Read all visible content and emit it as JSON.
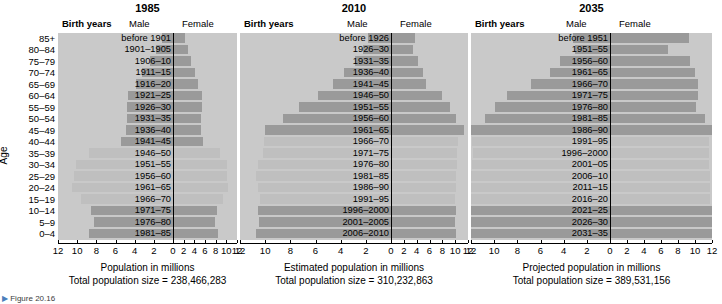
{
  "axis": {
    "age_title": "Age",
    "age_groups": [
      "85+",
      "80–84",
      "75–79",
      "70–74",
      "65–69",
      "60–64",
      "55–59",
      "50–54",
      "45–49",
      "40–44",
      "35–39",
      "30–34",
      "25–29",
      "20–24",
      "15–19",
      "10–14",
      "5–9",
      "0–4"
    ],
    "x_ticks": [
      "12",
      "10",
      "8",
      "6",
      "4",
      "2",
      "0",
      "2",
      "4",
      "6",
      "8",
      "10",
      "12"
    ],
    "x_tick_values": [
      -12,
      -10,
      -8,
      -6,
      -4,
      -2,
      0,
      2,
      4,
      6,
      8,
      10,
      12
    ]
  },
  "headers": {
    "birth_years": "Birth years",
    "male": "Male",
    "female": "Female"
  },
  "colors": {
    "plot_background": "#c9c9c9",
    "bar_dark": "#9a9a9a",
    "bar_light": "#bfbfbf",
    "centerline": "#000000",
    "page_background": "#ffffff"
  },
  "chart_data": {
    "type": "bar",
    "xlabel": "Population in millions",
    "ylabel": "Age",
    "xlim": [
      -12,
      12
    ],
    "grid": false,
    "legend": [
      "Male",
      "Female"
    ],
    "legend_position": "top",
    "categories": [
      "85+",
      "80–84",
      "75–79",
      "70–74",
      "65–69",
      "60–64",
      "55–59",
      "50–54",
      "45–49",
      "40–44",
      "35–39",
      "30–34",
      "25–29",
      "20–24",
      "15–19",
      "10–14",
      "5–9",
      "0–4"
    ],
    "panels": [
      {
        "year": "1985",
        "caption": "Population in millions",
        "total_label": "Total population size = 238,466,283",
        "total_population": 238466283,
        "birth_years": [
          "before 1901",
          "1901–1905",
          "1906–10",
          "1911–15",
          "1916–20",
          "1921–25",
          "1926–30",
          "1931–35",
          "1936–40",
          "1941–45",
          "1946–50",
          "1951–55",
          "1956–60",
          "1961–65",
          "1966–70",
          "1971–75",
          "1976–80",
          "1981–85"
        ],
        "series": [
          {
            "name": "Male",
            "values": [
              1.2,
              1.8,
              2.4,
              3.2,
              3.9,
              4.7,
              4.8,
              4.8,
              4.9,
              5.4,
              8.8,
              10.1,
              10.3,
              10.5,
              9.6,
              8.6,
              8.2,
              8.8
            ]
          },
          {
            "name": "Female",
            "values": [
              2.2,
              2.8,
              3.4,
              4.2,
              4.7,
              5.4,
              5.4,
              5.3,
              5.3,
              5.6,
              8.9,
              10.1,
              10.2,
              10.4,
              9.4,
              8.3,
              7.8,
              8.4
            ]
          }
        ],
        "boom_rows": [
          10,
          11,
          12,
          13,
          14
        ]
      },
      {
        "year": "2010",
        "caption": "Estimated population in millions",
        "total_label": "Total population size = 310,232,863",
        "total_population": 310232863,
        "birth_years": [
          "before 1926",
          "1926–30",
          "1931–35",
          "1936–40",
          "1941–45",
          "1946–50",
          "1951–55",
          "1956–60",
          "1961–65",
          "1966–70",
          "1971–75",
          "1976–80",
          "1981–85",
          "1986–90",
          "1991–95",
          "1996–2000",
          "2001–2005",
          "2006–2010"
        ],
        "series": [
          {
            "name": "Male",
            "values": [
              1.8,
              2.2,
              2.9,
              3.7,
              4.6,
              5.8,
              7.3,
              8.6,
              10.0,
              10.1,
              10.2,
              10.6,
              10.7,
              10.6,
              10.4,
              10.6,
              10.5,
              10.7
            ]
          },
          {
            "name": "Female",
            "values": [
              3.7,
              3.4,
              4.2,
              5.0,
              5.5,
              7.9,
              9.2,
              10.1,
              11.4,
              10.5,
              10.3,
              10.3,
              10.2,
              10.1,
              9.9,
              10.1,
              10.0,
              10.2
            ]
          }
        ],
        "boom_rows": [
          9,
          10,
          11,
          12,
          13,
          14
        ]
      },
      {
        "year": "2035",
        "caption": "Projected population in millions",
        "total_label": "Total population size = 389,531,156",
        "total_population": 389531156,
        "birth_years": [
          "before 1951",
          "1951–55",
          "1956–60",
          "1961–65",
          "1966–70",
          "1971–75",
          "1976–80",
          "1981–85",
          "1986–90",
          "1991–95",
          "1996–2000",
          "2001–05",
          "2006–10",
          "2011–15",
          "2016–20",
          "2021–25",
          "2026–30",
          "2031–35"
        ],
        "series": [
          {
            "name": "Male",
            "values": [
              3.2,
              3.0,
              4.3,
              5.2,
              6.8,
              8.9,
              9.9,
              10.8,
              12.0,
              11.9,
              11.8,
              11.9,
              12.0,
              12.1,
              12.1,
              12.3,
              12.4,
              12.4
            ]
          },
          {
            "name": "Female",
            "values": [
              9.3,
              6.8,
              9.4,
              10.0,
              10.4,
              10.4,
              10.1,
              11.2,
              12.2,
              11.7,
              11.6,
              11.7,
              11.8,
              11.8,
              11.8,
              12.2,
              12.3,
              12.3
            ]
          }
        ],
        "boom_rows": [
          9,
          10,
          11,
          12,
          13,
          14
        ]
      }
    ]
  },
  "figure_caption": "Figure 20.16"
}
